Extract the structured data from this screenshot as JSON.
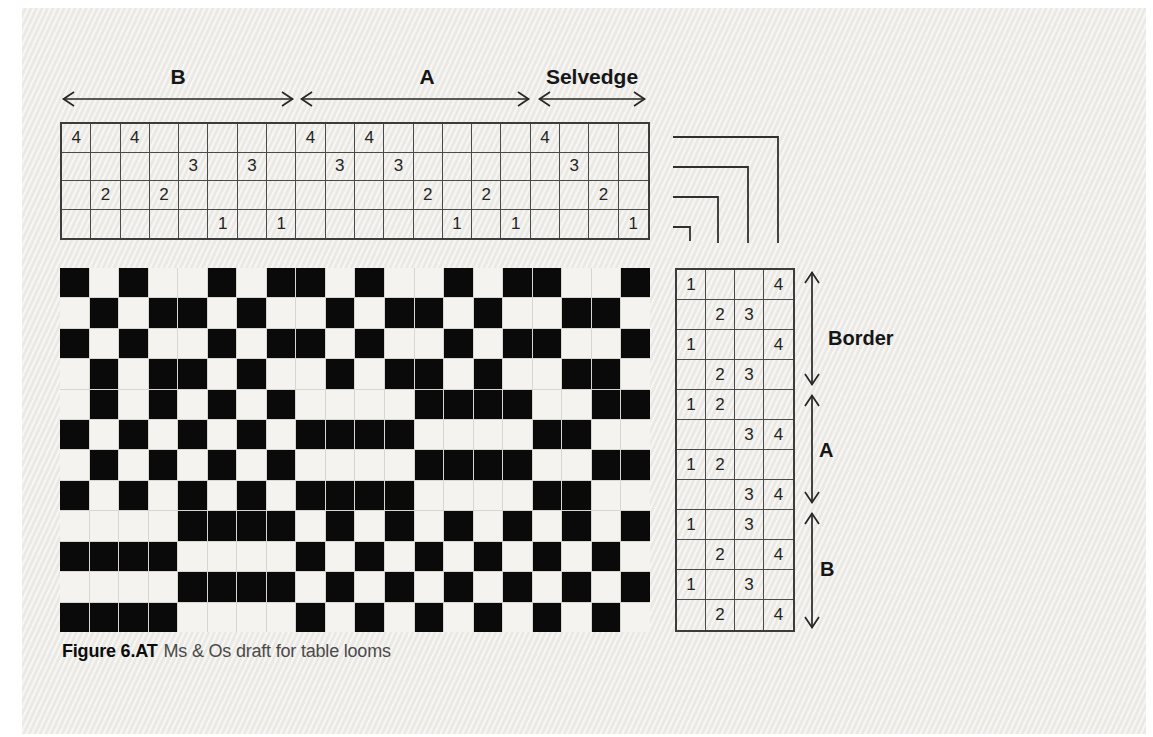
{
  "caption": {
    "number": "Figure 6.AT",
    "title": "Ms & Os draft for table looms"
  },
  "threading": {
    "shaft_rows": [
      4,
      3,
      2,
      1
    ],
    "sequence": [
      4,
      2,
      4,
      2,
      3,
      1,
      3,
      1,
      4,
      3,
      4,
      3,
      2,
      1,
      2,
      1,
      4,
      3,
      2,
      1
    ],
    "sections": [
      {
        "label": "B",
        "start_end": [
          1,
          8
        ]
      },
      {
        "label": "A",
        "start_end": [
          9,
          16
        ]
      },
      {
        "label": "Selvedge",
        "start_end": [
          17,
          20
        ]
      }
    ]
  },
  "liftplan": {
    "shaft_columns": [
      1,
      2,
      3,
      4
    ],
    "rows": [
      [
        1,
        null,
        null,
        4
      ],
      [
        null,
        2,
        3,
        null
      ],
      [
        1,
        null,
        null,
        4
      ],
      [
        null,
        2,
        3,
        null
      ],
      [
        1,
        2,
        null,
        null
      ],
      [
        null,
        null,
        3,
        4
      ],
      [
        1,
        2,
        null,
        null
      ],
      [
        null,
        null,
        3,
        4
      ],
      [
        1,
        null,
        3,
        null
      ],
      [
        null,
        2,
        null,
        4
      ],
      [
        1,
        null,
        3,
        null
      ],
      [
        null,
        2,
        null,
        4
      ]
    ],
    "sections": [
      {
        "label": "Border",
        "start_end": [
          1,
          4
        ]
      },
      {
        "label": "A",
        "start_end": [
          5,
          8
        ]
      },
      {
        "label": "B",
        "start_end": [
          9,
          12
        ]
      }
    ]
  },
  "drawdown": {
    "legend": "X = black (warp raised), . = white",
    "rows": [
      "X.X..X.XX.X..X.XX..X",
      ".X.XX.X..X.XX.X..XX.",
      "X.X..X.XX.X..X.XX..X",
      ".X.XX.X..X.XX.X..XX.",
      ".X.X.X.X....XXXX..XX",
      "X.X.X.X.XXXX....XX..",
      ".X.X.X.X....XXXX..XX",
      "X.X.X.X.XXXX....XX..",
      "....XXXX.X.X.X.X.X.X",
      "XXXX....X.X.X.X.X.X.",
      "....XXXX.X.X.X.X.X.X",
      "XXXX....X.X.X.X.X.X."
    ]
  },
  "colors": {
    "paper": "#efeeea",
    "ink": "#262626",
    "grid_line": "#4a4a4a",
    "drawdown_black": "#0a0a0a",
    "drawdown_white": "#f4f3ef"
  }
}
